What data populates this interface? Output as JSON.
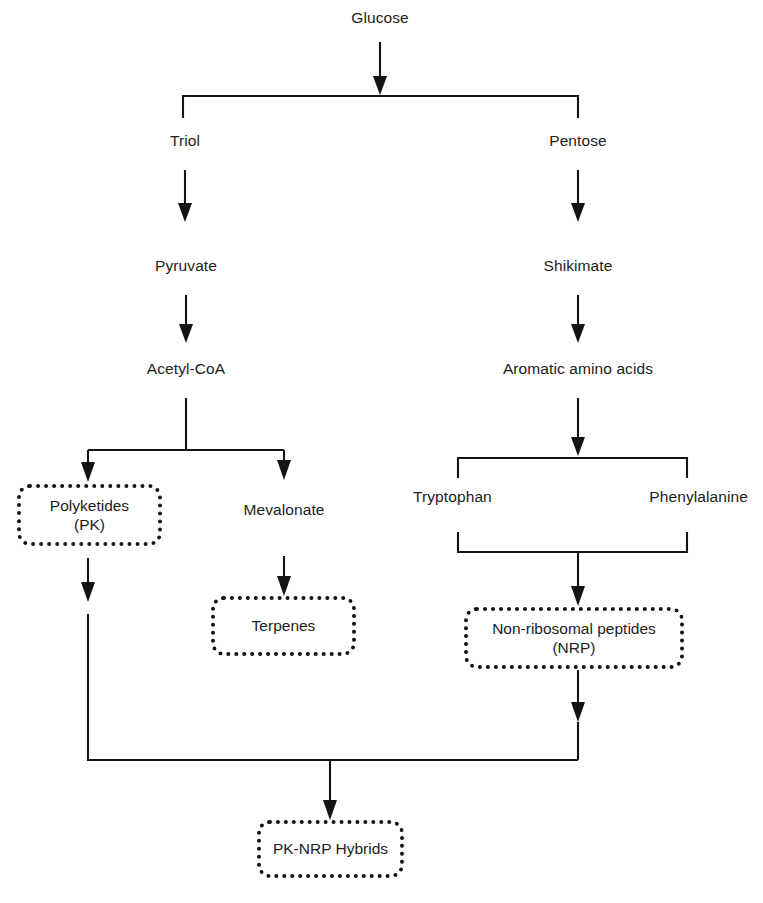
{
  "diagram": {
    "type": "flowchart",
    "background_color": "#ffffff",
    "line_color": "#141414",
    "text_color": "#1d1d1d",
    "nodes": {
      "glucose": {
        "label": "Glucose",
        "style": "plain"
      },
      "triol": {
        "label": "Triol",
        "style": "plain"
      },
      "pentose": {
        "label": "Pentose",
        "style": "plain"
      },
      "pyruvate": {
        "label": "Pyruvate",
        "style": "plain"
      },
      "shikimate": {
        "label": "Shikimate",
        "style": "plain"
      },
      "acetyl_coa": {
        "label": "Acetyl-CoA",
        "style": "plain"
      },
      "aromatic_amino_acids": {
        "label": "Aromatic amino acids",
        "style": "plain"
      },
      "polyketides": {
        "label": "Polyketides\n(PK)",
        "style": "dotted-box"
      },
      "mevalonate": {
        "label": "Mevalonate",
        "style": "plain"
      },
      "tryptophan": {
        "label": "Tryptophan",
        "style": "plain"
      },
      "phenylalanine": {
        "label": "Phenylalanine",
        "style": "plain"
      },
      "terpenes": {
        "label": "Terpenes",
        "style": "dotted-box"
      },
      "non_ribosomal_peptides": {
        "label": "Non-ribosomal peptides\n(NRP)",
        "style": "dotted-box"
      },
      "pk_nrp_hybrids": {
        "label": "PK-NRP Hybrids",
        "style": "dotted-box"
      }
    },
    "edges": [
      {
        "from": "glucose",
        "to": "split-triol-pentose",
        "kind": "arrow"
      },
      {
        "from": "split-triol-pentose",
        "to": "triol",
        "kind": "branch"
      },
      {
        "from": "split-triol-pentose",
        "to": "pentose",
        "kind": "branch"
      },
      {
        "from": "triol",
        "to": "pyruvate",
        "kind": "arrow"
      },
      {
        "from": "pyruvate",
        "to": "acetyl_coa",
        "kind": "arrow"
      },
      {
        "from": "pentose",
        "to": "shikimate",
        "kind": "arrow"
      },
      {
        "from": "shikimate",
        "to": "aromatic_amino_acids",
        "kind": "arrow"
      },
      {
        "from": "acetyl_coa",
        "to": "polyketides",
        "kind": "branch-arrow"
      },
      {
        "from": "acetyl_coa",
        "to": "mevalonate",
        "kind": "branch-arrow"
      },
      {
        "from": "mevalonate",
        "to": "terpenes",
        "kind": "arrow"
      },
      {
        "from": "aromatic_amino_acids",
        "to": "tryptophan",
        "kind": "branch"
      },
      {
        "from": "aromatic_amino_acids",
        "to": "phenylalanine",
        "kind": "branch"
      },
      {
        "from": "tryptophan",
        "to": "non_ribosomal_peptides",
        "kind": "merge-arrow"
      },
      {
        "from": "phenylalanine",
        "to": "non_ribosomal_peptides",
        "kind": "merge-arrow"
      },
      {
        "from": "polyketides",
        "to": "pk_nrp_hybrids",
        "kind": "merge-arrow"
      },
      {
        "from": "non_ribosomal_peptides",
        "to": "pk_nrp_hybrids",
        "kind": "merge-arrow"
      }
    ]
  }
}
